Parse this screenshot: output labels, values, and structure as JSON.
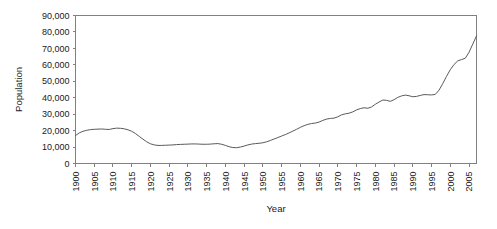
{
  "chart_data": {
    "type": "line",
    "title": "",
    "xlabel": "Year",
    "ylabel": "Population",
    "xlim": [
      1900,
      2007
    ],
    "ylim": [
      0,
      90000
    ],
    "grid": false,
    "legend": false,
    "legend_position": "none",
    "line_color": "#5a5a5a",
    "axis_color": "#808080",
    "ytick_labels": [
      "90,000",
      "80,000",
      "70,000",
      "60,000",
      "50,000",
      "40,000",
      "30,000",
      "20,000",
      "10,000",
      "0"
    ],
    "ytick_values": [
      90000,
      80000,
      70000,
      60000,
      50000,
      40000,
      30000,
      20000,
      10000,
      0
    ],
    "xtick_labels": [
      "1900",
      "1905",
      "1910",
      "1915",
      "1920",
      "1925",
      "1930",
      "1935",
      "1940",
      "1945",
      "1950",
      "1955",
      "1960",
      "1965",
      "1970",
      "1975",
      "1980",
      "1985",
      "1990",
      "1995",
      "2000",
      "2005"
    ],
    "xtick_values": [
      1900,
      1905,
      1910,
      1915,
      1920,
      1925,
      1930,
      1935,
      1940,
      1945,
      1950,
      1955,
      1960,
      1965,
      1970,
      1975,
      1980,
      1985,
      1990,
      1995,
      2000,
      2005
    ],
    "series": [
      {
        "name": "Population",
        "x": [
          1900,
          1901,
          1902,
          1903,
          1904,
          1905,
          1906,
          1907,
          1908,
          1909,
          1910,
          1911,
          1912,
          1913,
          1914,
          1915,
          1916,
          1917,
          1918,
          1919,
          1920,
          1921,
          1922,
          1923,
          1924,
          1925,
          1926,
          1927,
          1928,
          1929,
          1930,
          1931,
          1932,
          1933,
          1934,
          1935,
          1936,
          1937,
          1938,
          1939,
          1940,
          1941,
          1942,
          1943,
          1944,
          1945,
          1946,
          1947,
          1948,
          1949,
          1950,
          1951,
          1952,
          1953,
          1954,
          1955,
          1956,
          1957,
          1958,
          1959,
          1960,
          1961,
          1962,
          1963,
          1964,
          1965,
          1966,
          1967,
          1968,
          1969,
          1970,
          1971,
          1972,
          1973,
          1974,
          1975,
          1976,
          1977,
          1978,
          1979,
          1980,
          1981,
          1982,
          1983,
          1984,
          1985,
          1986,
          1987,
          1988,
          1989,
          1990,
          1991,
          1992,
          1993,
          1994,
          1995,
          1996,
          1997,
          1998,
          1999,
          2000,
          2001,
          2002,
          2003,
          2004,
          2005,
          2006,
          2007
        ],
        "values": [
          17000,
          18600,
          19600,
          20200,
          20600,
          20800,
          20900,
          21000,
          20800,
          20700,
          21200,
          21500,
          21400,
          21100,
          20500,
          19600,
          18200,
          16500,
          14800,
          13200,
          12000,
          11300,
          11000,
          11000,
          11100,
          11200,
          11300,
          11500,
          11600,
          11700,
          11800,
          11900,
          11900,
          11800,
          11700,
          11700,
          11800,
          12000,
          12100,
          11700,
          11000,
          10200,
          9700,
          9600,
          10000,
          10600,
          11300,
          11800,
          12100,
          12300,
          12600,
          13200,
          14000,
          14900,
          15800,
          16700,
          17600,
          18600,
          19700,
          20800,
          22000,
          23000,
          23800,
          24300,
          24600,
          25200,
          26200,
          27000,
          27400,
          27600,
          28400,
          29600,
          30200,
          30600,
          31400,
          32600,
          33400,
          33900,
          33600,
          34400,
          36000,
          37400,
          38600,
          38400,
          37800,
          38800,
          40200,
          41100,
          41600,
          41200,
          40600,
          40800,
          41400,
          41900,
          41800,
          41700,
          42000,
          44600,
          48600,
          53000,
          57000,
          60200,
          62400,
          63200,
          64000,
          67600,
          72600,
          77600
        ]
      }
    ]
  }
}
